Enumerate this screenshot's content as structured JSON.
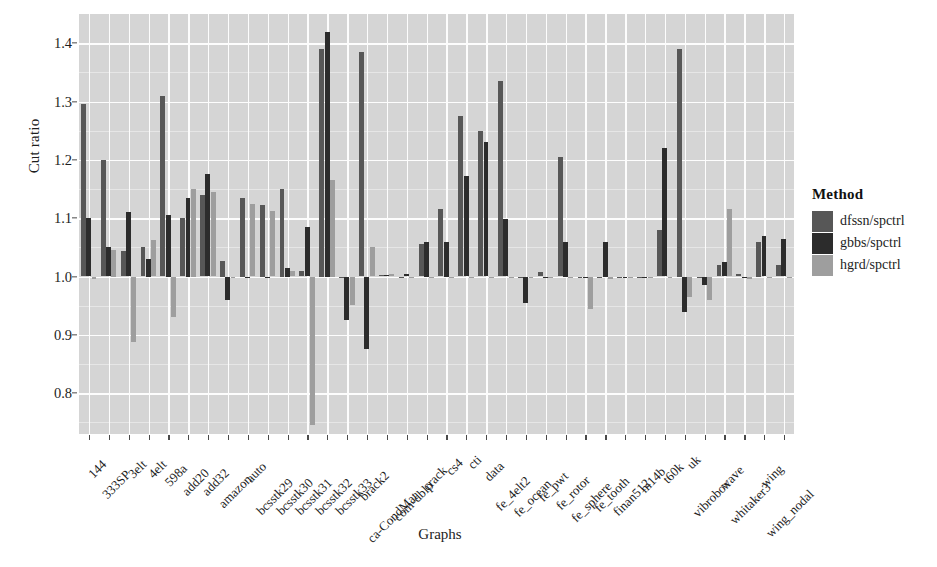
{
  "chart_data": {
    "type": "bar",
    "title": "",
    "xlabel": "Graphs",
    "ylabel": "Cut ratio",
    "ylim": [
      0.73,
      1.45
    ],
    "yticks": [
      0.8,
      0.9,
      1.0,
      1.1,
      1.2,
      1.3,
      1.4
    ],
    "ytick_labels": [
      "0.8",
      "0.9",
      "1.0",
      "1.1",
      "1.2",
      "1.3",
      "1.4"
    ],
    "baseline": 1.0,
    "grid": true,
    "legend_position": "right",
    "legend_title": "Method",
    "categories": [
      "144",
      "333SP",
      "3elt",
      "4elt",
      "598a",
      "add20",
      "add32",
      "amazon",
      "auto",
      "bcsstk29",
      "bcsstk30",
      "bcsstk31",
      "bcsstk32",
      "bcsstk33",
      "brack2",
      "ca-CondMat",
      "com-dblp",
      "crack",
      "cs4",
      "cti",
      "data",
      "fe_4elt2",
      "fe_ocean",
      "fe_pwt",
      "fe_rotor",
      "fe_sphere",
      "fe_tooth",
      "finan512",
      "m14b",
      "t60k",
      "uk",
      "vibrobox",
      "wave",
      "whitaker3",
      "wing",
      "wing_nodal"
    ],
    "series": [
      {
        "name": "dfssn/spctrl",
        "color": "#575757",
        "values": [
          1.295,
          1.2,
          1.044,
          1.05,
          1.31,
          1.1,
          1.14,
          1.027,
          1.135,
          1.123,
          1.15,
          1.01,
          1.39,
          0.998,
          1.385,
          1.003,
          1.0,
          1.055,
          1.115,
          1.275,
          1.25,
          1.335,
          0.999,
          1.008,
          1.205,
          1.0,
          0.997,
          0.999,
          0.999,
          1.08,
          1.39,
          1.0,
          1.02,
          1.005,
          1.06,
          1.02
        ]
      },
      {
        "name": "gbbs/spctrl",
        "color": "#2c2c2c",
        "values": [
          1.1,
          1.05,
          1.11,
          1.03,
          1.105,
          1.135,
          1.175,
          0.96,
          1.0,
          1.0,
          1.015,
          1.085,
          1.42,
          0.925,
          0.875,
          1.003,
          1.005,
          1.06,
          1.06,
          1.172,
          1.23,
          1.098,
          0.955,
          1.0,
          1.06,
          0.998,
          1.06,
          1.0,
          1.0,
          1.22,
          0.94,
          0.985,
          1.025,
          1.0,
          1.07,
          1.065
        ]
      },
      {
        "name": "hgrd/spctrl",
        "color": "#9e9e9e",
        "values": [
          0.995,
          1.045,
          0.888,
          1.062,
          0.93,
          1.15,
          1.145,
          1.0,
          1.125,
          1.112,
          1.01,
          0.745,
          1.165,
          0.952,
          1.05,
          1.005,
          1.0,
          1.0,
          1.0,
          1.0,
          1.0,
          1.0,
          0.999,
          1.0,
          1.0,
          0.945,
          0.995,
          0.998,
          1.0,
          1.0,
          0.965,
          0.96,
          1.115,
          0.995,
          1.0,
          1.0
        ]
      }
    ]
  },
  "axes": {
    "y_title": "Cut ratio",
    "x_title": "Graphs"
  },
  "legend": {
    "title": "Method",
    "items": [
      {
        "label": "dfssn/spctrl",
        "color": "#575757"
      },
      {
        "label": "gbbs/spctrl",
        "color": "#2c2c2c"
      },
      {
        "label": "hgrd/spctrl",
        "color": "#9e9e9e"
      }
    ]
  },
  "panel": {
    "background": "#d5d5d5",
    "gridline_color": "#fdfdfd"
  }
}
